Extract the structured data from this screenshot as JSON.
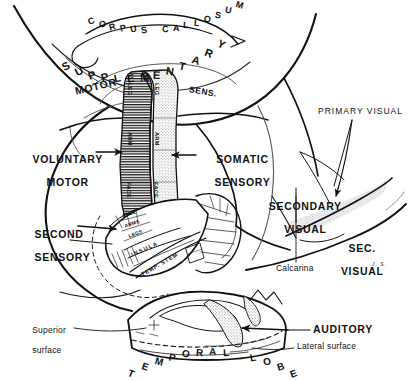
{
  "figure": {
    "background_color": "#ffffff",
    "ink_color": "#111111",
    "stipple_color": "#9a9a9a",
    "signature": "J. S."
  },
  "labels": {
    "corpus_callosum": "CORPUS CALLOSUM",
    "supplementary": "SUPPLEMENTARY",
    "supp_motor": "MOTOR",
    "supp_sens": "SENS.",
    "voluntary_motor_l1": "VOLUNTARY",
    "voluntary_motor_l2": "MOTOR",
    "somatic_sensory_l1": "SOMATIC",
    "somatic_sensory_l2": "SENSORY",
    "second_sensory_l1": "SECOND",
    "second_sensory_l2": "SENSORY",
    "primary_visual": "PRIMARY VISUAL",
    "secondary_visual_l1": "SECONDARY",
    "secondary_visual_l2": "VISUAL",
    "sec_visual_l1": "SEC.",
    "sec_visual_l2": "VISUAL",
    "calcarina": "Calcarina",
    "auditory": "AUDITORY",
    "superior_surface_l1": "Superior",
    "superior_surface_l2": "surface",
    "lateral_surface": "Lateral surface",
    "temporal_lobe": "TEMPORAL LOBE"
  },
  "homunculus": {
    "motor_strip": [
      "LEG",
      "ARM",
      "FACE"
    ],
    "sensory_strip": [
      "LEG",
      "ARM",
      "FACE"
    ]
  },
  "insula_region": {
    "face": "FACE",
    "arms": "ARMS",
    "legs": "LEGS",
    "insula": "INSULA",
    "temp_stem": "TEMP. STEM"
  },
  "arc_text": {
    "corpus_callosum_chars": [
      "C",
      "O",
      "R",
      "P",
      "U",
      "S",
      " ",
      "C",
      "A",
      "L",
      "L",
      "O",
      "S",
      "U",
      "M"
    ],
    "supplementary_chars": [
      "S",
      "U",
      "P",
      "P",
      "L",
      "E",
      "M",
      "E",
      "N",
      "T",
      "A",
      "R",
      "Y"
    ],
    "temporal_lobe_chars": [
      "T",
      "E",
      "M",
      "P",
      "O",
      "R",
      "A",
      "L",
      " ",
      "L",
      "O",
      "B",
      "E"
    ]
  }
}
